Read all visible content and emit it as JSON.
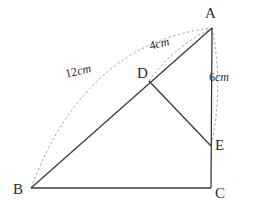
{
  "diagram": {
    "type": "geometry-figure",
    "background_color": "#ffffff",
    "stroke_color": "#3a3a3a",
    "dash_color": "#9a9a9a",
    "vertices": [
      {
        "id": "A",
        "label": "A",
        "x": 212,
        "y": 28
      },
      {
        "id": "B",
        "label": "B",
        "x": 31,
        "y": 188
      },
      {
        "id": "C",
        "label": "C",
        "x": 211,
        "y": 188
      },
      {
        "id": "D",
        "label": "D",
        "x": 149,
        "y": 81
      },
      {
        "id": "E",
        "label": "E",
        "x": 211,
        "y": 146
      }
    ],
    "segments": [
      {
        "name": "segment-BA",
        "from": "B",
        "to": "A",
        "style": "solid"
      },
      {
        "name": "segment-BC",
        "from": "B",
        "to": "C",
        "style": "solid"
      },
      {
        "name": "segment-AC",
        "from": "A",
        "to": "C",
        "style": "solid"
      },
      {
        "name": "segment-DE",
        "from": "D",
        "to": "E",
        "style": "solid"
      }
    ],
    "measurements": [
      {
        "name": "length-BA",
        "value": "12",
        "unit": "cm",
        "text": "12cm",
        "from": "B",
        "to": "A",
        "style": "dashed-arc"
      },
      {
        "name": "length-DA",
        "value": "4",
        "unit": "cm",
        "text": "4cm",
        "from": "D",
        "to": "A",
        "style": "dashed-arc"
      },
      {
        "name": "length-EA",
        "value": "6",
        "unit": "cm",
        "text": "6cm",
        "from": "E",
        "to": "A",
        "style": "dashed-arc"
      }
    ]
  }
}
